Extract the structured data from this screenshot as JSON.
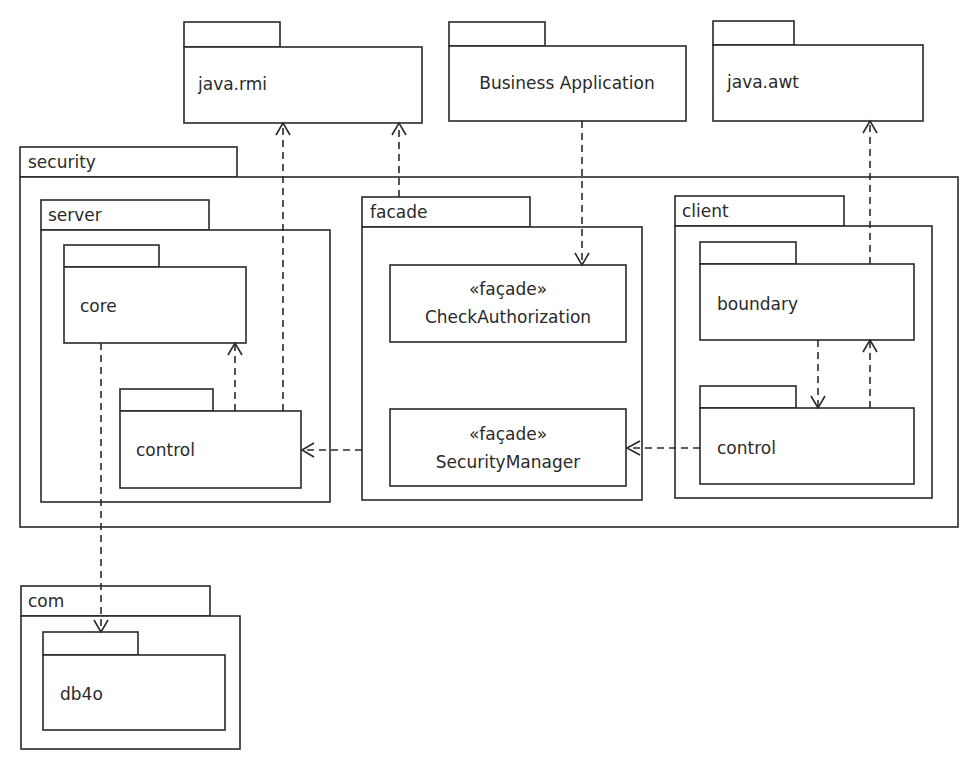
{
  "diagram": {
    "type": "UML package diagram",
    "colors": {
      "stroke": "#2a2a2a",
      "background": "#ffffff"
    },
    "packages": {
      "java_rmi": {
        "label": "java.rmi"
      },
      "business_application": {
        "label": "Business Application"
      },
      "java_awt": {
        "label": "java.awt"
      },
      "security": {
        "label": "security",
        "server": {
          "label": "server",
          "core": {
            "label": "core"
          },
          "control": {
            "label": "control"
          }
        },
        "facade": {
          "label": "facade",
          "check_authorization": {
            "stereotype": "«façade»",
            "label": "CheckAuthorization"
          },
          "security_manager": {
            "stereotype": "«façade»",
            "label": "SecurityManager"
          }
        },
        "client": {
          "label": "client",
          "boundary": {
            "label": "boundary"
          },
          "control": {
            "label": "control"
          }
        }
      },
      "com": {
        "label": "com",
        "db4o": {
          "label": "db4o"
        }
      }
    },
    "dependencies": [
      {
        "from": "security.server.control",
        "to": "java.rmi"
      },
      {
        "from": "security.facade",
        "to": "java.rmi"
      },
      {
        "from": "Business Application",
        "to": "security.facade.CheckAuthorization"
      },
      {
        "from": "security.client.boundary",
        "to": "java.awt"
      },
      {
        "from": "security.server.control",
        "to": "security.server.core"
      },
      {
        "from": "security.facade",
        "to": "security.server.control"
      },
      {
        "from": "security.client.control",
        "to": "security.facade.SecurityManager"
      },
      {
        "from": "security.client.boundary",
        "to": "security.client.control"
      },
      {
        "from": "security.client.control",
        "to": "security.client.boundary"
      },
      {
        "from": "security.server.core",
        "to": "com.db4o"
      }
    ]
  }
}
